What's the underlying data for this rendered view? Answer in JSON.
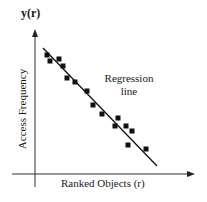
{
  "chart_data": {
    "type": "scatter",
    "title": "",
    "xlabel": "Ranked Objects (r)",
    "ylabel": "Access Frequency",
    "y_axis_symbol": "y(r)",
    "grid": false,
    "ticks": "none",
    "annotation": {
      "line1": "Regression",
      "line2": "line"
    },
    "series": [
      {
        "name": "observed points",
        "marker": "square",
        "points_px": [
          [
            47,
            55
          ],
          [
            50,
            61
          ],
          [
            59,
            59
          ],
          [
            63,
            66
          ],
          [
            67,
            78
          ],
          [
            75,
            82
          ],
          [
            87,
            91
          ],
          [
            93,
            105
          ],
          [
            102,
            114
          ],
          [
            118,
            118
          ],
          [
            115,
            126
          ],
          [
            126,
            126
          ],
          [
            132,
            131
          ],
          [
            128,
            145
          ],
          [
            146,
            149
          ]
        ]
      },
      {
        "name": "Regression line",
        "type": "line",
        "from_px": [
          43,
          48
        ],
        "to_px": [
          157,
          166
        ]
      }
    ],
    "colors": {
      "ink": "#111111",
      "background": "#ffffff"
    }
  },
  "labels": {
    "y_symbol": "y(r)",
    "y_axis": "Access Frequency",
    "x_axis": "Ranked Objects (r)",
    "annotation_line1": "Regression",
    "annotation_line2": "line"
  }
}
